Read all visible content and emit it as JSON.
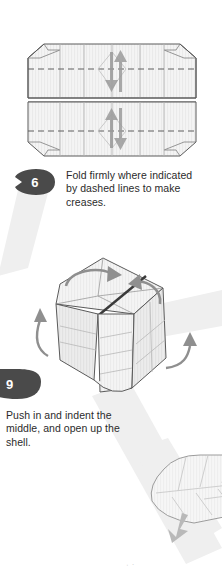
{
  "page": {
    "background_color": "#ffffff",
    "width": 222,
    "height": 579
  },
  "palette": {
    "badge_fill": "#4a4a4a",
    "badge_text": "#ffffff",
    "body_text": "#2b2b2b",
    "paper_fill": "#f2f2f2",
    "paper_fill_light": "#f7f7f7",
    "paper_fill_shade": "#e8e8e8",
    "outline": "#5a5a5a",
    "crease_line": "#9a9a9a",
    "dashed_line": "#6e6e6e",
    "arrow_gray": "#8c8c8c",
    "arrow_dark": "#7a7a7a",
    "watermark_gray": "#ededed",
    "faint_outline": "#d8d8d8",
    "faint_caption": "#cfcfcf"
  },
  "steps": [
    {
      "number": "6",
      "badge_icon": "leaf-badge-icon",
      "text": "Fold firmly where indicated by dashed lines to make creases."
    },
    {
      "number": "9",
      "badge_icon": "leaf-badge-icon",
      "text": "Push in and indent the middle, and open up the shell."
    }
  ],
  "figures": [
    {
      "id": "figure-step-6",
      "name": "flattened-octagon-crease-pattern",
      "description": "Flattened octagonal paper form shown face-on with vertical crease lines, two horizontal dashed fold lines, a solid central horizontal fold, and two opposing valley-fold arrows in the middle.",
      "arrow_count": 2,
      "dashed_fold_lines": 2,
      "solid_center_fold_lines": 1
    },
    {
      "id": "figure-step-9",
      "name": "three-dimensional-box-form",
      "description": "Three dimensional boxy shell seen from above-left with a dark diagonal crease across the top face, two curved rotation arrows on the top face, and two outward opening arrows at left and right.",
      "rotation_arrow_count": 2,
      "outward_arrow_count": 2
    },
    {
      "id": "figure-next-partial",
      "name": "partial-next-step-form",
      "description": "Partially visible rounded shell form cropped by the bottom right page edge with a downward pointing arrow.",
      "arrow_count": 1
    }
  ],
  "bottom_caption": "· ·",
  "icons": {
    "leaf_badge": "leaf-badge-icon",
    "fold_arrow": "fold-arrow-icon",
    "rotate_arrow": "rotate-arrow-icon",
    "open_arrow": "open-arrow-icon",
    "down_arrow": "down-arrow-icon"
  }
}
